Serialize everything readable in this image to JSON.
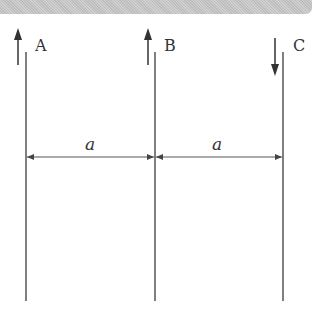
{
  "wires": [
    {
      "label": "A",
      "current_direction": "up"
    },
    {
      "label": "B",
      "current_direction": "up"
    },
    {
      "label": "C",
      "current_direction": "down"
    }
  ],
  "dimensions": [
    {
      "label": "a",
      "from": "A",
      "to": "B"
    },
    {
      "label": "a",
      "from": "B",
      "to": "C"
    }
  ]
}
